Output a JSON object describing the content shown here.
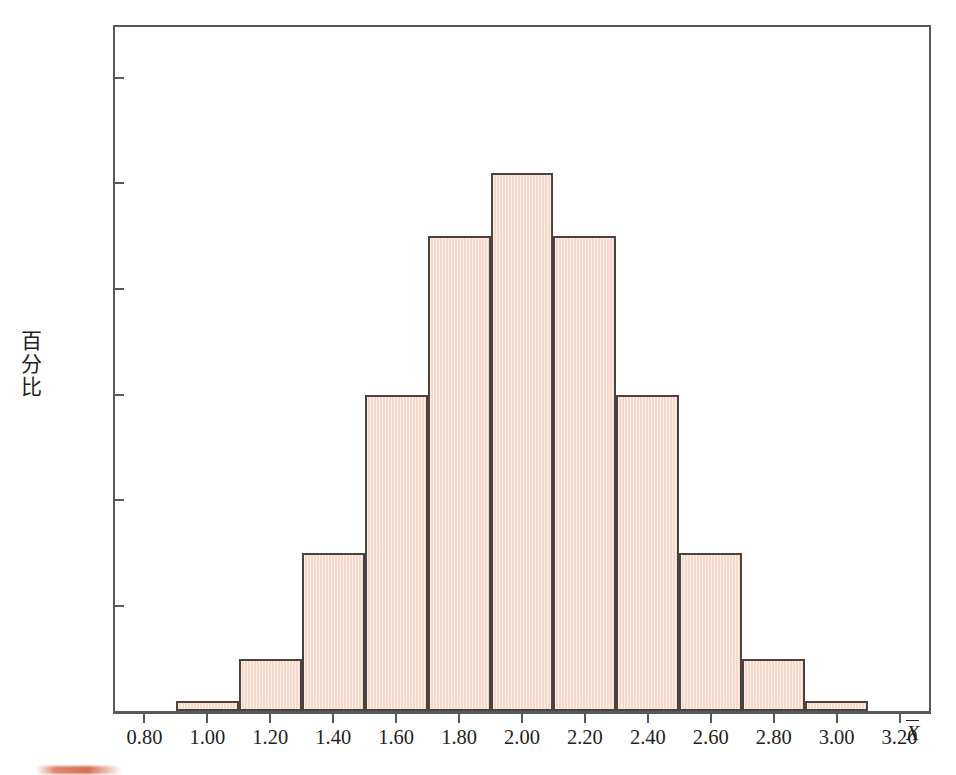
{
  "chart_data": {
    "type": "bar",
    "title": "",
    "subtitle": "",
    "xlabel": "X̄",
    "ylabel": "百分比",
    "xlim": [
      0.7,
      3.3
    ],
    "ylim": [
      0,
      26.75
    ],
    "grid": false,
    "legend": null,
    "bin_width": 0.2,
    "bin_edges": [
      0.9,
      1.1,
      1.3,
      1.5,
      1.7,
      1.9,
      2.1,
      2.3,
      2.5,
      2.7,
      2.9,
      3.1
    ],
    "categories": [
      "0.90-1.10",
      "1.10-1.30",
      "1.30-1.50",
      "1.50-1.70",
      "1.70-1.90",
      "1.90-2.10",
      "2.10-2.30",
      "2.30-2.50",
      "2.50-2.70",
      "2.70-2.90",
      "2.90-3.10"
    ],
    "values": [
      0.41,
      2.06,
      6.18,
      12.35,
      18.53,
      20.99,
      18.53,
      12.35,
      6.18,
      2.06,
      0.41
    ],
    "xticks": [
      0.8,
      1.0,
      1.2,
      1.4,
      1.6,
      1.8,
      2.0,
      2.2,
      2.4,
      2.6,
      2.8,
      3.0,
      3.2
    ],
    "xtick_labels": [
      "0.80",
      "1.00",
      "1.20",
      "1.40",
      "1.60",
      "1.80",
      "2.00",
      "2.20",
      "2.40",
      "2.60",
      "2.80",
      "3.00",
      "3.20"
    ],
    "yticks": [
      4.12,
      8.23,
      12.35,
      16.46,
      20.58,
      24.69
    ],
    "ytick_labels": [
      "4.12",
      "8.23",
      "12.35",
      "16.46",
      "20.58",
      "24.69"
    ],
    "colors": {
      "bar_fill": "#f7ddd0",
      "bar_stroke": "#4a4340",
      "axis": "#58595b",
      "text": "#231f20",
      "background": "#ffffff"
    }
  },
  "axis_titles": {
    "y": "百分比",
    "x_symbol": "X"
  }
}
